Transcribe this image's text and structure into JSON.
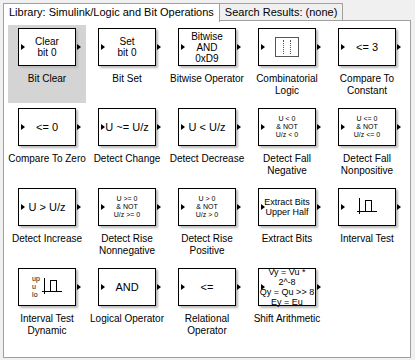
{
  "tabs": [
    {
      "label": "Library: Simulink/Logic and Bit Operations",
      "active": true
    },
    {
      "label": "Search Results: (none)",
      "active": false
    }
  ],
  "blocks": [
    {
      "name": "Bit Clear",
      "icon_text": "Clear\nbit 0",
      "selected": true
    },
    {
      "name": "Bit Set",
      "icon_text": "Set\nbit 0"
    },
    {
      "name": "Bitwise Operator",
      "icon_text": "Bitwise\nAND\n0xD9"
    },
    {
      "name": "Combinatorial\nLogic",
      "icon_text": "[⋮⋮]"
    },
    {
      "name": "Compare To\nConstant",
      "icon_text": "<= 3"
    },
    {
      "name": "Compare To Zero",
      "icon_text": "<= 0"
    },
    {
      "name": "Detect Change",
      "icon_text": "U ~= U/z"
    },
    {
      "name": "Detect Decrease",
      "icon_text": "U < U/z"
    },
    {
      "name": "Detect Fall\nNegative",
      "icon_text": "U < 0\n& NOT\nU/z < 0"
    },
    {
      "name": "Detect Fall\nNonpositive",
      "icon_text": "U <= 0\n& NOT\nU/z <= 0"
    },
    {
      "name": "Detect Increase",
      "icon_text": "U > U/z"
    },
    {
      "name": "Detect Rise\nNonnegative",
      "icon_text": "U >= 0\n& NOT\nU/z >= 0"
    },
    {
      "name": "Detect Rise\nPositive",
      "icon_text": "U > 0\n& NOT\nU/z > 0"
    },
    {
      "name": "Extract Bits",
      "icon_text": "Extract Bits\nUpper Half"
    },
    {
      "name": "Interval Test",
      "icon_text": "interval-pulse"
    },
    {
      "name": "Interval Test\nDynamic",
      "icon_text": "up\nu\nlo"
    },
    {
      "name": "Logical Operator",
      "icon_text": "AND"
    },
    {
      "name": "Relational\nOperator",
      "icon_text": "<="
    },
    {
      "name": "Shift Arithmetic",
      "icon_text": "Vy = Vu * 2^-8\nQy = Qu >> 8\nEy = Eu"
    }
  ]
}
